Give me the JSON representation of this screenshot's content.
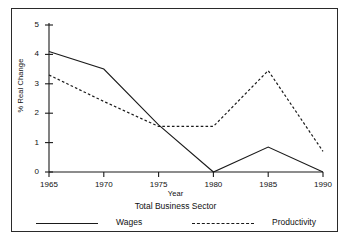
{
  "chart_data": {
    "type": "line",
    "title": "Total Business Sector",
    "xlabel": "Year",
    "ylabel": "% Real Change",
    "x": [
      1965,
      1970,
      1975,
      1980,
      1985,
      1990
    ],
    "xtick_labels": [
      "1965",
      "1970",
      "1975",
      "1980",
      "1985",
      "1990"
    ],
    "ytick_labels": [
      "0",
      "1",
      "2",
      "3",
      "4",
      "5"
    ],
    "yticks": [
      0,
      1,
      2,
      3,
      4,
      5
    ],
    "xlim": [
      1965,
      1990
    ],
    "ylim": [
      0,
      5
    ],
    "grid": false,
    "legend_position": "bottom",
    "series": [
      {
        "name": "Wages",
        "style": "solid",
        "color": "#1a1a1a",
        "values": [
          4.1,
          3.5,
          1.6,
          0.0,
          0.85,
          0.0
        ]
      },
      {
        "name": "Productivity",
        "style": "dashed",
        "color": "#1a1a1a",
        "values": [
          3.3,
          2.4,
          1.55,
          1.55,
          3.45,
          0.7
        ]
      }
    ]
  },
  "legend": {
    "wages_label": "Wages",
    "productivity_label": "Productivity"
  },
  "colors": {
    "frame": "#2a2a2a",
    "axis": "#1a1a1a",
    "text": "#111111"
  }
}
